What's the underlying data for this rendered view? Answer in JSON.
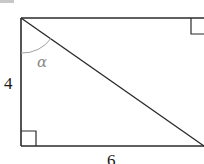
{
  "diagram": {
    "type": "geometry",
    "shape": "rectangle with diagonal",
    "labels": {
      "height": "4",
      "width": "6",
      "angle": "α"
    },
    "angle_marker": "arc at top-left vertex between left side and diagonal",
    "right_angle_markers": [
      "bottom-left",
      "top-right"
    ],
    "colors": {
      "stroke": "#2a2a2a",
      "arc": "#9a9a9a",
      "background": "#ffffff"
    }
  }
}
